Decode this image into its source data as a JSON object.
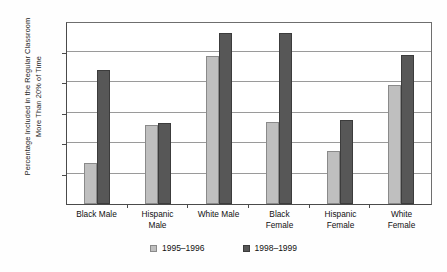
{
  "chart_data": {
    "type": "bar",
    "title": "",
    "xlabel": "",
    "ylabel": "Percentage Included in the Regular Classroom More Than 20% of Time",
    "ylabel_line1": "Percentage Included in the Regular Classroom",
    "ylabel_line2": "More Than 20% of Time",
    "categories": [
      "Black Male",
      "Hispanic Male",
      "White Male",
      "Black Female",
      "Hispanic Female",
      "White Female"
    ],
    "category_lines": [
      [
        "Black Male"
      ],
      [
        "Hispanic",
        "Male"
      ],
      [
        "White Male"
      ],
      [
        "Black",
        "Female"
      ],
      [
        "Hispanic",
        "Female"
      ],
      [
        "White",
        "Female"
      ]
    ],
    "series": [
      {
        "name": "1995–1996",
        "color": "#bfbfbf",
        "values": [
          2.7,
          5.2,
          9.7,
          5.4,
          3.5,
          7.8
        ]
      },
      {
        "name": "1998–1999",
        "color": "#575757",
        "values": [
          8.8,
          5.3,
          11.2,
          11.2,
          5.5,
          9.8
        ]
      }
    ],
    "ylim": [
      0,
      12
    ],
    "yticks": [
      0,
      2,
      4,
      6,
      8,
      10,
      12
    ],
    "ytick_labels": [
      "0",
      "2",
      "4",
      "6",
      "8",
      "10",
      "12"
    ],
    "grid": true,
    "grid_axis": "y",
    "legend_position": "bottom"
  }
}
